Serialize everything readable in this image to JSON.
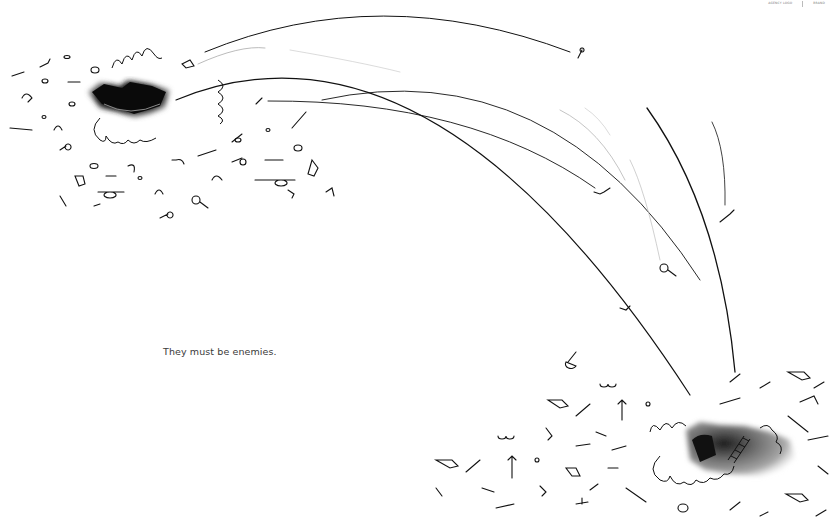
{
  "ad": {
    "tagline": "They must be enemies.",
    "background_color": "#ffffff",
    "ink_color": "#111111",
    "logos": {
      "left_text": "AGENCY LOGO",
      "right_text": "BRAND"
    }
  },
  "scene": {
    "left_hole": {
      "description": "dark torn hole with debris",
      "cx": 130,
      "cy": 100
    },
    "right_hole": {
      "description": "grey hole with ladder inside",
      "cx": 735,
      "cy": 450
    },
    "arcs_count": 9,
    "debris_clusters": [
      "left",
      "right"
    ]
  }
}
